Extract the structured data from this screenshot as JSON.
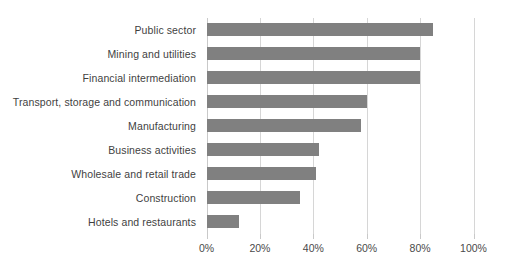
{
  "chart_data": {
    "type": "bar",
    "orientation": "horizontal",
    "title": "",
    "subtitle": "",
    "xlabel": "",
    "ylabel": "",
    "xlim": [
      0,
      100
    ],
    "grid": true,
    "legend": false,
    "bar_color": "#808080",
    "gridline_color": "#d6d6d6",
    "label_color": "#3f3f3f",
    "categories": [
      "Public sector",
      "Mining and utilities",
      "Financial intermediation",
      "Transport, storage and communication",
      "Manufacturing",
      "Business activities",
      "Wholesale and retail trade",
      "Construction",
      "Hotels and restaurants"
    ],
    "values": [
      85,
      80,
      80,
      60,
      58,
      42,
      41,
      35,
      12
    ],
    "xticks": [
      0,
      20,
      40,
      60,
      80,
      100
    ],
    "xtick_labels": [
      "0%",
      "20%",
      "40%",
      "60%",
      "80%",
      "100%"
    ]
  }
}
